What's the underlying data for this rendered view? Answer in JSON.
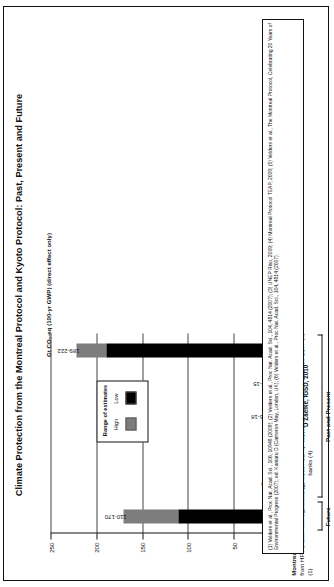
{
  "title": "Climate Protection from the Montreal Protocol and Kyoto Protocol: Past, Present and Future",
  "credit": "D Zaelke, IGSD, 2010",
  "legend": {
    "title": "Range of estimates",
    "high_label": "High",
    "low_label": "Low",
    "high_color": "#7d7d7d",
    "low_color": "#000000"
  },
  "footnote": "(1) Velders et al., Proc Nat. Acad. Sci., 106, 10949 (2009); (2) Velders et al., Proc Nat. Acad. Sci., 104, 4814 (2007); (3) UNEP Riso, 2009; (4) Montreal Protocol TEAP, 2009; (5) Velders et al., The Montreal Protocol, Celebrating 20 Years of Environmental Progress (2007), ed. Kaniaru D (Cameron May, London, UK); (6) Velders et al., Proc Nat. Acad. Sci., 104, 4814 (2007).",
  "groups": [
    {
      "label": "Future",
      "bars": [
        0
      ]
    },
    {
      "label": "Past and Present",
      "bars": [
        1,
        2,
        3,
        4,
        5
      ]
    }
  ],
  "chart_data": {
    "type": "bar",
    "title": "Climate Protection from the Montreal Protocol and Kyoto Protocol: Past, Present and Future",
    "xlabel": "",
    "ylabel": "Gt CO₂-eq (100-yr GWP) (direct effect only)",
    "ylim": [
      0,
      250
    ],
    "yticks": [
      0,
      50,
      100,
      150,
      200,
      250
    ],
    "grid": true,
    "legend_position": "inside-center",
    "orientation": "vertical-bars-rotated-page",
    "categories": [
      "Montreal Protocol:  Potential mitigation from HFC phase-out: 2013 through 2050 (1)",
      "Kyoto Protocol:  1st commitment period: 2008 through 2012 (2)",
      "Kyoto Protocol:  Clean Development Mechanism (CDM) projects (3)",
      "Montreal Protocol:  Potential mitigation from ozone-depleting substance (ODS) banks (4)",
      "Montreal Protocol:  2007 HCFC accelerated phase-out for 2013-2050 (5)",
      "Montreal Protocol:  Phase-out of ODSs: 1990 through 2010 (6)"
    ],
    "category_parts": [
      {
        "bold": "Montreal Protocol:",
        "rest": "  Potential mitigation from HFC phase-out: 2013 through 2050 (1)"
      },
      {
        "bold": "Kyoto Protocol:",
        "rest": "  1st commitment period: 2008 through 2012 (2)"
      },
      {
        "bold": "Kyoto Protocol:",
        "rest": "  Clean Development Mechanism (CDM) projects (3)"
      },
      {
        "bold": "Montreal Protocol:",
        "rest": "  Potential mitigation from ozone-depleting substance (ODS) banks (4)"
      },
      {
        "bold": "Montreal Protocol:",
        "rest": "  2007 HCFC accelerated phase-out for 2013-2050 (5)"
      },
      {
        "bold": "Montreal Protocol:",
        "rest": "  Phase-out of ODSs: 1990 through 2010 (6)"
      }
    ],
    "value_labels": [
      "110-170",
      "9-10",
      "1.5",
      "16-18",
      "12-15",
      "189-222"
    ],
    "series": [
      {
        "name": "Low",
        "values": [
          110,
          9,
          1.5,
          16,
          12,
          189
        ]
      },
      {
        "name": "High",
        "values": [
          170,
          10,
          1.5,
          18,
          15,
          222
        ]
      }
    ]
  }
}
